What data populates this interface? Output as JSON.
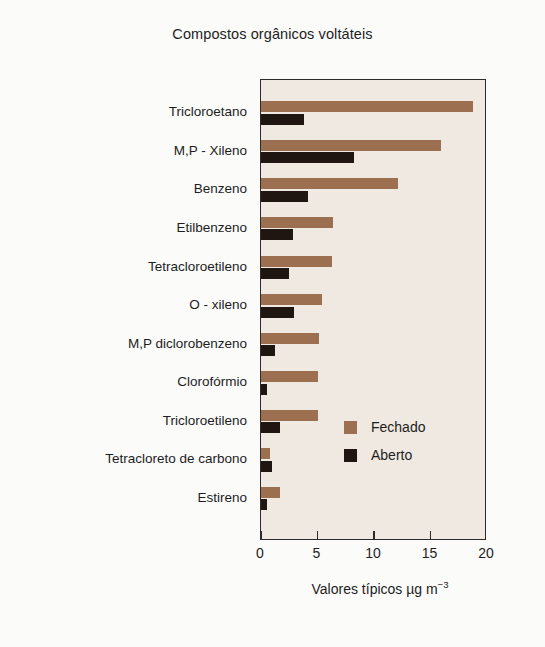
{
  "chart_data": {
    "type": "bar",
    "orientation": "horizontal",
    "title": "Compostos orgânicos voltáteis",
    "xlabel": "Valores típicos µg m",
    "xlabel_exponent": "−3",
    "ylabel": "",
    "xlim": [
      0,
      20
    ],
    "xticks": [
      0,
      5,
      10,
      15,
      20
    ],
    "xtick_labels": [
      "0",
      "5",
      "10",
      "15",
      "20"
    ],
    "grid": false,
    "legend_position": "center-right-inside",
    "categories": [
      "Tricloroetano",
      "M,P - Xileno",
      "Benzeno",
      "Etilbenzeno",
      "Tetracloroetileno",
      "O - xileno",
      "M,P diclorobenzeno",
      "Clorofórmio",
      "Tricloroetileno",
      "Tetracloreto de carbono",
      "Estireno"
    ],
    "series": [
      {
        "name": "Fechado",
        "color": "#9c6f50",
        "values": [
          18.8,
          15.9,
          12.1,
          6.4,
          6.3,
          5.4,
          5.1,
          5.0,
          5.0,
          0.8,
          1.7
        ]
      },
      {
        "name": "Aberto",
        "color": "#201611",
        "values": [
          3.8,
          8.2,
          4.2,
          2.8,
          2.5,
          2.9,
          1.2,
          0.5,
          1.7,
          1.0,
          0.5
        ]
      }
    ]
  },
  "legend": {
    "items": [
      {
        "label": "Fechado",
        "color": "#9c6f50"
      },
      {
        "label": "Aberto",
        "color": "#201611"
      }
    ]
  },
  "colors": {
    "fechado": "#9c6f50",
    "aberto": "#201611",
    "plot_background": "#efe9e1",
    "figure_background": "#fbfbfa",
    "axis": "#2b2b2b"
  }
}
